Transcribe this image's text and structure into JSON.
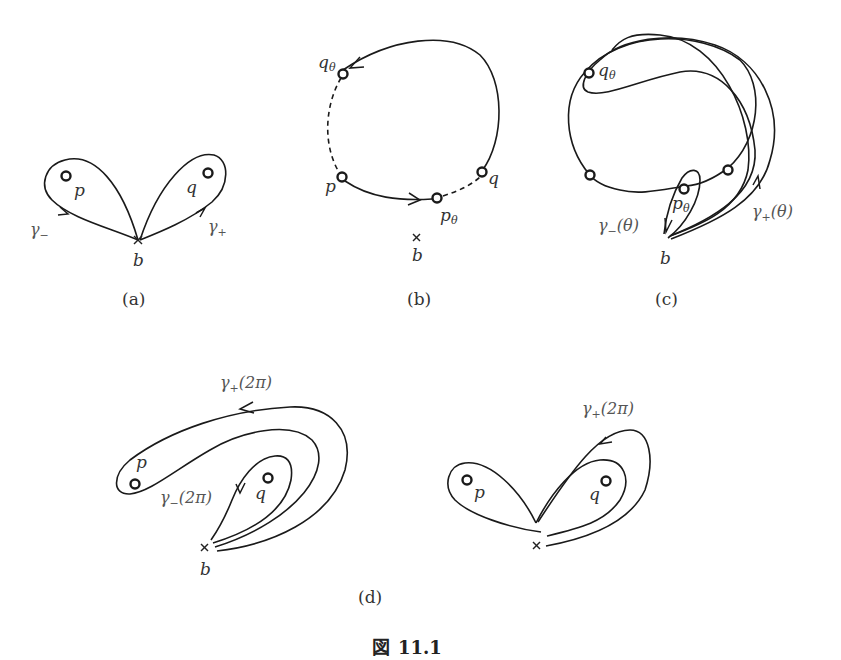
{
  "figure": {
    "caption_prefix": "図",
    "caption_number": "11.1"
  },
  "panels": {
    "a": {
      "caption": "(a)",
      "labels": {
        "p": "p",
        "q": "q",
        "b": "b",
        "gamma_minus": "γ",
        "gamma_minus_sub": "−",
        "gamma_plus": "γ",
        "gamma_plus_sub": "+"
      }
    },
    "b": {
      "caption": "(b)",
      "labels": {
        "q_theta": "q",
        "q_theta_sub": "θ",
        "p": "p",
        "p_theta": "p",
        "p_theta_sub": "θ",
        "q": "q",
        "b": "b"
      }
    },
    "c": {
      "caption": "(c)",
      "labels": {
        "q_theta": "q",
        "q_theta_sub": "θ",
        "p_theta": "p",
        "p_theta_sub": "θ",
        "gamma_minus": "γ",
        "gamma_minus_sub": "−",
        "gamma_minus_arg": "(θ)",
        "gamma_plus": "γ",
        "gamma_plus_sub": "+",
        "gamma_plus_arg": "(θ)",
        "b": "b"
      }
    },
    "d": {
      "caption": "(d)",
      "left": {
        "labels": {
          "gamma_plus": "γ",
          "gamma_plus_sub": "+",
          "gamma_plus_arg": "(2π)",
          "p": "p",
          "q": "q",
          "gamma_minus": "γ",
          "gamma_minus_sub": "−",
          "gamma_minus_arg": "(2π)",
          "b": "b"
        }
      },
      "right": {
        "labels": {
          "gamma_plus": "γ",
          "gamma_plus_sub": "+",
          "gamma_plus_arg": "(2π)",
          "p": "p",
          "q": "q"
        }
      }
    }
  }
}
